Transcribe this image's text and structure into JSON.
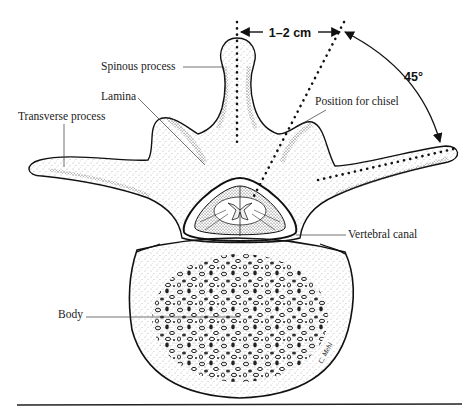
{
  "figure": {
    "labels": {
      "spinous_process": "Spinous process",
      "lamina": "Lamina",
      "transverse_process": "Transverse process",
      "position_for_chisel": "Position for chisel",
      "vertebral_canal": "Vertebral canal",
      "body": "Body"
    },
    "measurements": {
      "distance": "1–2 cm",
      "angle": "45°"
    },
    "signature": "C. Mehl",
    "colors": {
      "ink": "#111111",
      "stipple": "#555555",
      "background": "#ffffff"
    }
  }
}
